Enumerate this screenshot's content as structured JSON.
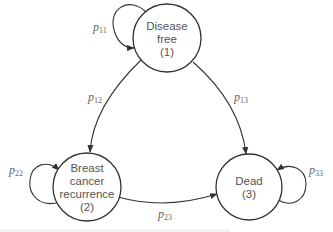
{
  "diagram": {
    "type": "markov-state-transition",
    "nodes": [
      {
        "id": 1,
        "lines": [
          "Disease",
          "free",
          "(1)"
        ]
      },
      {
        "id": 2,
        "lines": [
          "Breast",
          "cancer",
          "recurrence",
          "(2)"
        ]
      },
      {
        "id": 3,
        "lines": [
          "Dead",
          "(3)"
        ]
      }
    ],
    "edges": [
      {
        "from": 1,
        "to": 1,
        "label_base": "p",
        "label_sub": "11"
      },
      {
        "from": 1,
        "to": 2,
        "label_base": "p",
        "label_sub": "12"
      },
      {
        "from": 1,
        "to": 3,
        "label_base": "p",
        "label_sub": "13"
      },
      {
        "from": 2,
        "to": 2,
        "label_base": "p",
        "label_sub": "22"
      },
      {
        "from": 2,
        "to": 3,
        "label_base": "p",
        "label_sub": "23"
      },
      {
        "from": 3,
        "to": 3,
        "label_base": "p",
        "label_sub": "33"
      }
    ],
    "colors": {
      "stroke": "#333333",
      "node_text": "#555555",
      "edge_label": "#666666"
    }
  }
}
